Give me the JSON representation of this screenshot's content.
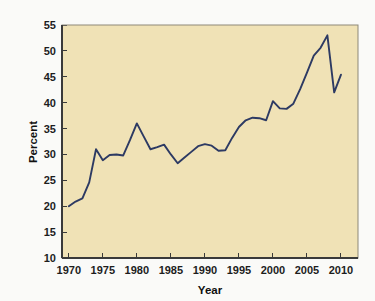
{
  "chart_data": {
    "type": "line",
    "title": "",
    "subtitle": "",
    "xlabel": "Year",
    "ylabel": "Percent",
    "xlim": [
      1969,
      2012.5
    ],
    "ylim": [
      10,
      55
    ],
    "xticks": [
      1970,
      1975,
      1980,
      1985,
      1990,
      1995,
      2000,
      2005,
      2010
    ],
    "yticks": [
      10,
      15,
      20,
      25,
      30,
      35,
      40,
      45,
      50,
      55
    ],
    "grid": false,
    "legend": null,
    "legend_position": "none",
    "annotations": [],
    "series": [
      {
        "name": "Percent",
        "color": "#2d3a63",
        "x": [
          1970,
          1971,
          1972,
          1973,
          1974,
          1975,
          1976,
          1977,
          1978,
          1979,
          1980,
          1981,
          1982,
          1983,
          1984,
          1985,
          1986,
          1987,
          1988,
          1989,
          1990,
          1991,
          1992,
          1993,
          1994,
          1995,
          1996,
          1997,
          1998,
          1999,
          2000,
          2001,
          2002,
          2003,
          2004,
          2005,
          2006,
          2007,
          2008,
          2009,
          2010
        ],
        "values": [
          20.0,
          20.9,
          21.5,
          24.6,
          31.0,
          28.9,
          29.9,
          30.0,
          29.8,
          32.8,
          36.0,
          33.5,
          31.0,
          31.4,
          31.9,
          30.0,
          28.3,
          29.4,
          30.5,
          31.6,
          32.0,
          31.7,
          30.7,
          30.8,
          33.2,
          35.3,
          36.6,
          37.1,
          37.0,
          36.6,
          40.3,
          38.9,
          38.8,
          39.8,
          42.6,
          45.8,
          49.1,
          50.6,
          53.0,
          42.0,
          45.4
        ]
      }
    ]
  },
  "axes": {
    "y_title": "Percent",
    "x_title": "Year",
    "y_tick_labels": [
      "55",
      "50",
      "45",
      "40",
      "35",
      "30",
      "25",
      "20",
      "15",
      "10"
    ],
    "x_tick_labels": [
      "1970",
      "1975",
      "1980",
      "1985",
      "1990",
      "1995",
      "2000",
      "2005",
      "2010"
    ]
  },
  "colors": {
    "line": "#2d3a63",
    "plot_background": "#f0e2b6",
    "page_background": "#fafaf8",
    "frame": "#8d8878",
    "text": "#1d1d1d"
  }
}
